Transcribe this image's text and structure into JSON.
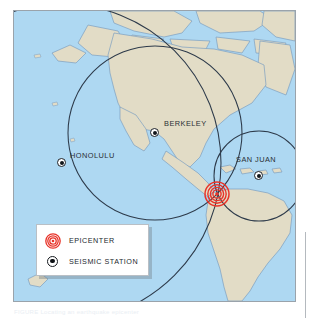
{
  "figure": {
    "title_caption": "FIGURE  Locating an earthquake epicenter",
    "frame": {
      "left": 13,
      "top": 10,
      "width": 283,
      "height": 292
    }
  },
  "colors": {
    "ocean": "#aed8f2",
    "land": "#e2dcc6",
    "coastline": "#7d9fc0",
    "circle_stroke": "#2d3a4a",
    "epicenter_red": "#e8342a",
    "frame_border": "#9aa3ab",
    "legend_bg": "#ffffff",
    "label_text": "#2a2f35"
  },
  "map": {
    "projection_note": "North and South America, Pacific and Atlantic oceans",
    "stations": [
      {
        "name": "BERKELEY",
        "label": "BERKELEY",
        "dot_x": 141,
        "dot_y": 122,
        "label_x": 150,
        "label_y": 112
      },
      {
        "name": "HONOLULU",
        "label": "HONOLULU",
        "dot_x": 48,
        "dot_y": 152,
        "label_x": 57,
        "label_y": 144
      },
      {
        "name": "SAN JUAN",
        "label": "SAN JUAN",
        "dot_x": 245,
        "dot_y": 165,
        "label_x": 224,
        "label_y": 148
      }
    ],
    "epicenter": {
      "label": "EPICENTER",
      "x": 203,
      "y": 183,
      "rings": 5
    },
    "distance_circles": [
      {
        "station": "BERKELEY",
        "cx": 141,
        "cy": 122,
        "r": 87
      },
      {
        "station": "HONOLULU",
        "cx": 48,
        "cy": 152,
        "r": 159
      },
      {
        "station": "SAN JUAN",
        "cx": 245,
        "cy": 165,
        "r": 45
      }
    ]
  },
  "legend": {
    "rows": [
      {
        "icon": "epicenter-rings-icon",
        "label": "EPICENTER"
      },
      {
        "icon": "seismic-station-dot-icon",
        "label": "SEISMIC STATION"
      }
    ]
  }
}
